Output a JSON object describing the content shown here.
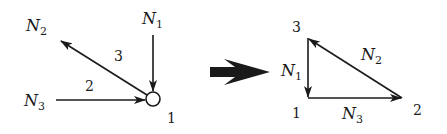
{
  "left_diagram": {
    "node_label": "1",
    "forces": [
      {
        "name": "N",
        "sub": "1",
        "member": ""
      },
      {
        "name": "N",
        "sub": "2",
        "member": "3"
      },
      {
        "name": "N",
        "sub": "3",
        "member": "2"
      }
    ]
  },
  "right_diagram": {
    "vertices": [
      "3",
      "1",
      "2"
    ],
    "sides": [
      {
        "name": "N",
        "sub": "1"
      },
      {
        "name": "N",
        "sub": "2"
      },
      {
        "name": "N",
        "sub": "3"
      }
    ]
  },
  "colors": {
    "ink": "#1a1a1a",
    "background": "#ffffff"
  }
}
